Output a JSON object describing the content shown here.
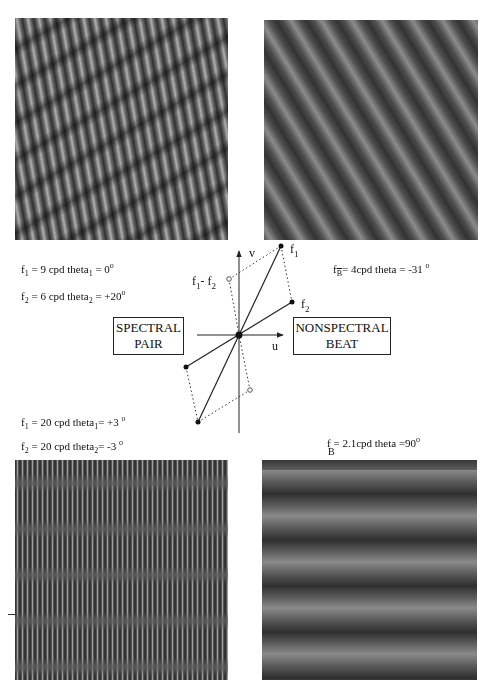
{
  "panels": {
    "top_left": {
      "description": "spectral pair compound grating"
    },
    "top_right": {
      "description": "nonspectral beat grating"
    },
    "bottom_left": {
      "description": "spectral pair compound grating (fine)"
    },
    "bottom_right": {
      "description": "nonspectral beat grating (horizontal)"
    }
  },
  "labels": {
    "top_left": {
      "line1": {
        "f": "f",
        "sub": "1",
        "eq": " = 9 cpd  theta",
        "tsub": "1",
        "val": " = 0",
        "sup": "o"
      },
      "line2": {
        "f": "f",
        "sub": "2",
        "eq": " = 6 cpd  theta",
        "tsub": "2",
        "val": " = +20",
        "sup": "o"
      }
    },
    "top_right": {
      "f": "f",
      "sub": "B",
      "eq": "= 4cpd  theta  = -31 ",
      "sup": "o"
    },
    "bottom_left": {
      "line1": {
        "f": "f",
        "sub": "1",
        "eq": " = 20 cpd  theta",
        "tsub": "1",
        "val": "= +3 ",
        "sup": "o"
      },
      "line2": {
        "f": "f",
        "sub": "2",
        "eq": " = 20 cpd  theta",
        "tsub": "2",
        "val": "= -3 ",
        "sup": "o"
      }
    },
    "bottom_right": {
      "f": "f",
      "eq": " = 2.1cpd  theta  =90",
      "sup": "o",
      "sub": "B"
    }
  },
  "boxes": {
    "spectral": {
      "line1": "SPECTRAL",
      "line2": "PAIR"
    },
    "nonspectral": {
      "line1": "NONSPECTRAL",
      "line2": "BEAT"
    }
  },
  "diagram": {
    "axis_u": "u",
    "axis_v": "v",
    "f1": "f",
    "f1_sub": "1",
    "f2": "f",
    "f2_sub": "2",
    "diff": "f",
    "diff_sub1": "1",
    "diff_mid": "- f",
    "diff_sub2": "2"
  }
}
